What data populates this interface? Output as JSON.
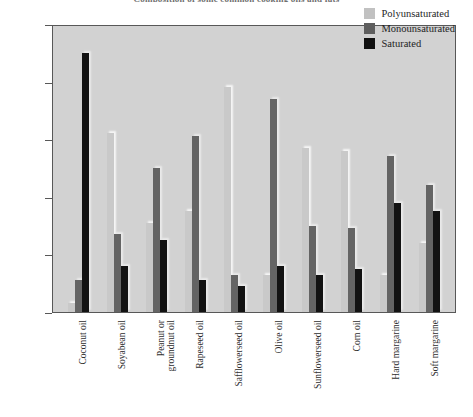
{
  "chart_data": {
    "type": "bar",
    "title": "Composition of some common cooking oils and fats",
    "xlabel": "",
    "ylabel": "",
    "ylim": [
      0,
      100
    ],
    "ytick_labels": [
      "100%",
      "80%",
      "60%",
      "40%",
      "20%",
      "0%"
    ],
    "ytick_values": [
      100,
      80,
      60,
      40,
      20,
      0
    ],
    "grid": false,
    "legend_position": "top-right",
    "categories": [
      "Coconut oil",
      "Soyabean oil",
      "Peanut or groundnut oil",
      "Rapeseed oil",
      "Safflowerseed oil",
      "Olive oil",
      "Sunflowerseed oil",
      "Corn oil",
      "Hard margarine",
      "Soft margarine"
    ],
    "category_lines": [
      [
        "Coconut oil"
      ],
      [
        "Soyabean oil"
      ],
      [
        "Peanut or",
        "groundnut oil"
      ],
      [
        "Rapeseed oil"
      ],
      [
        "Safflowerseed oil"
      ],
      [
        "Olive oil"
      ],
      [
        "Sunflowerseed oil"
      ],
      [
        "Corn oil"
      ],
      [
        "Hard margarine"
      ],
      [
        "Soft margarine"
      ]
    ],
    "series": [
      {
        "name": "Polyunsaturated",
        "color": "#c9c9c9",
        "values": [
          3,
          62,
          31,
          35,
          78,
          13,
          57,
          56,
          13,
          24
        ]
      },
      {
        "name": "Monounsaturated",
        "color": "#646464",
        "values": [
          11,
          27,
          50,
          61,
          13,
          74,
          30,
          29,
          54,
          44
        ]
      },
      {
        "name": "Saturated",
        "color": "#121212",
        "values": [
          90,
          16,
          25,
          11,
          9,
          16,
          13,
          15,
          38,
          35
        ]
      }
    ]
  },
  "legend": {
    "items": [
      {
        "label": "Polyunsaturated",
        "color": "#c1c1c1"
      },
      {
        "label": "Monounsaturated",
        "color": "#5e5e5e"
      },
      {
        "label": "Saturated",
        "color": "#101010"
      }
    ]
  },
  "colors": {
    "plot_background": "#d2d2d2",
    "page_background": "#ffffff",
    "axis": "#585858",
    "tick_text": "#4a4a4a",
    "label_text": "#2e2e2e"
  }
}
